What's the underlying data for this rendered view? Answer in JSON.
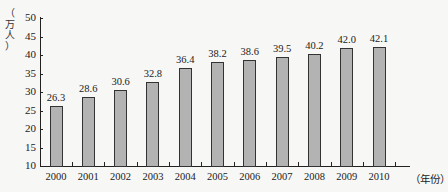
{
  "chart_data": {
    "type": "bar",
    "title": "",
    "xlabel": "（年份）",
    "ylabel": "（万人）",
    "ylim": [
      10,
      50
    ],
    "yticks": [
      10,
      15,
      20,
      25,
      30,
      35,
      40,
      45,
      50
    ],
    "grid": false,
    "categories": [
      "2000",
      "2001",
      "2002",
      "2003",
      "2004",
      "2005",
      "2006",
      "2007",
      "2008",
      "2009",
      "2010"
    ],
    "values": [
      26.3,
      28.6,
      30.6,
      32.8,
      36.4,
      38.2,
      38.6,
      39.5,
      40.2,
      42.0,
      42.1
    ],
    "value_labels": [
      "26.3",
      "28.6",
      "30.6",
      "32.8",
      "36.4",
      "38.2",
      "38.6",
      "39.5",
      "40.2",
      "42.0",
      "42.1"
    ]
  },
  "ylabel_chars": [
    "（",
    "万",
    "人",
    "）"
  ],
  "bar_color": "#b3b3b3"
}
